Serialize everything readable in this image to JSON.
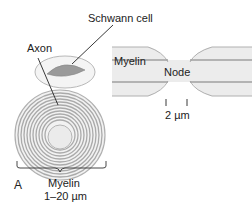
{
  "figure": {
    "panel_label": "A",
    "cross_section": {
      "labels": {
        "schwann_cell": "Schwann cell",
        "axon": "Axon",
        "myelin": "Myelin",
        "myelin_thickness": "1–20 µm"
      }
    },
    "longitudinal": {
      "labels": {
        "myelin": "Myelin",
        "node": "Node",
        "node_width": "2 µm"
      }
    },
    "colors": {
      "myelin_fill": "#ececec",
      "myelin_ring": "#a8a8a8",
      "schwann_cell": "#9a9a9a",
      "axon_fill": "#ebebeb",
      "outline": "#b0b0b0",
      "text": "#222222"
    }
  }
}
